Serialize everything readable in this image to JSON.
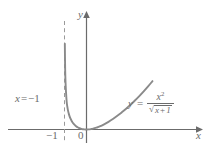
{
  "chart_data": {
    "type": "line",
    "title": "",
    "xlabel": "x",
    "ylabel": "y",
    "function": "y = x^2 / sqrt(x + 1)",
    "xlim": [
      -1.45,
      3.3
    ],
    "ylim": [
      -0.55,
      10.2
    ],
    "grid": false,
    "legend": null,
    "asymptotes": [
      {
        "type": "vertical",
        "value": -1,
        "label": "x = −1",
        "style": "dashed"
      }
    ],
    "xticks": [
      -1,
      0
    ],
    "xtick_labels": [
      "−1",
      "0"
    ],
    "yticks": [],
    "ytick_labels": [],
    "series": [
      {
        "name": "y = x^2/sqrt(x+1)",
        "color": "#8a8a8a",
        "x": [
          -0.985,
          -0.97,
          -0.95,
          -0.93,
          -0.9,
          -0.87,
          -0.84,
          -0.8,
          -0.76,
          -0.72,
          -0.68,
          -0.64,
          -0.6,
          -0.55,
          -0.5,
          -0.45,
          -0.4,
          -0.35,
          -0.3,
          -0.25,
          -0.2,
          -0.15,
          -0.1,
          -0.05,
          0.0,
          0.1,
          0.2,
          0.3,
          0.45,
          0.6,
          0.8,
          1.0,
          1.2,
          1.4,
          1.6,
          1.8,
          2.0,
          2.2,
          2.4,
          2.6,
          2.8,
          3.0
        ],
        "y": [
          7.97,
          5.58,
          4.25,
          3.44,
          2.56,
          2.1,
          1.76,
          1.43,
          1.18,
          0.98,
          0.82,
          0.68,
          0.57,
          0.45,
          0.35,
          0.27,
          0.21,
          0.15,
          0.11,
          0.07,
          0.04,
          0.02,
          0.01,
          0.0,
          0.0,
          0.01,
          0.04,
          0.08,
          0.17,
          0.28,
          0.48,
          0.71,
          0.97,
          1.27,
          1.59,
          1.93,
          2.31,
          2.7,
          3.11,
          3.55,
          4.01,
          4.5
        ]
      }
    ]
  },
  "labels": {
    "y_axis": "y",
    "x_axis": "x",
    "tick_minus_one": "−1",
    "tick_zero": "0",
    "asymptote_var": "x",
    "asymptote_equals": "=",
    "asymptote_value": "−1",
    "equation_lhs": "y",
    "equation_equals": "=",
    "equation_numerator_base": "x",
    "equation_numerator_exponent": "2",
    "equation_radical_sign": "√",
    "equation_denominator_var": "x",
    "equation_denominator_op": "+",
    "equation_denominator_const": "1"
  },
  "colors": {
    "curve": "#8a8a8a",
    "axis": "#6b6b6b",
    "asymptote": "#9a9a9a",
    "text": "#6b6b6b",
    "background": "#ffffff"
  }
}
